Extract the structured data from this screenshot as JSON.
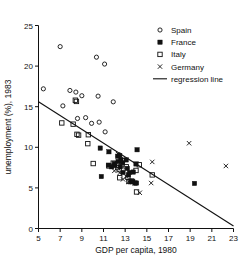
{
  "chart_data": {
    "type": "scatter",
    "title": "",
    "xlabel": "GDP per capita, 1980",
    "ylabel": "unemployment (%), 1983",
    "xlim": [
      5,
      23
    ],
    "ylim": [
      0,
      25
    ],
    "xticks": [
      5,
      7,
      9,
      11,
      13,
      15,
      17,
      19,
      21,
      23
    ],
    "yticks": [
      0,
      5,
      10,
      15,
      20,
      25
    ],
    "grid": false,
    "legend_position": "top-right",
    "legend": [
      {
        "name": "Spain",
        "marker": "open-circle"
      },
      {
        "name": "France",
        "marker": "filled-square"
      },
      {
        "name": "Italy",
        "marker": "open-square"
      },
      {
        "name": "Germany",
        "marker": "cross-x"
      },
      {
        "name": "regression line",
        "marker": "line"
      }
    ],
    "series": [
      {
        "name": "Spain",
        "marker": "open-circle",
        "points": [
          [
            5.45,
            17.2
          ],
          [
            7.0,
            22.4
          ],
          [
            7.25,
            15.1
          ],
          [
            7.9,
            17.0
          ],
          [
            8.45,
            16.8
          ],
          [
            8.6,
            13.55
          ],
          [
            9.0,
            16.35
          ],
          [
            9.35,
            13.65
          ],
          [
            9.9,
            12.95
          ],
          [
            10.35,
            21.1
          ],
          [
            10.5,
            16.3
          ],
          [
            10.6,
            13.1
          ],
          [
            11.1,
            20.25
          ],
          [
            11.15,
            11.9
          ],
          [
            11.9,
            15.6
          ]
        ]
      },
      {
        "name": "France",
        "marker": "filled-square",
        "points": [
          [
            10.7,
            9.9
          ],
          [
            10.8,
            6.4
          ],
          [
            11.5,
            9.45
          ],
          [
            11.45,
            7.8
          ],
          [
            11.75,
            7.6
          ],
          [
            12.0,
            8.0
          ],
          [
            12.05,
            7.75
          ],
          [
            12.3,
            8.9
          ],
          [
            12.35,
            8.25
          ],
          [
            12.5,
            9.0
          ],
          [
            12.55,
            7.6
          ],
          [
            12.6,
            8.5
          ],
          [
            12.75,
            8.1
          ],
          [
            12.8,
            6.9
          ],
          [
            13.1,
            8.45
          ],
          [
            13.2,
            7.4
          ],
          [
            13.3,
            6.6
          ],
          [
            13.4,
            6.9
          ],
          [
            13.5,
            5.75
          ],
          [
            13.7,
            5.8
          ],
          [
            13.75,
            6.95
          ],
          [
            13.9,
            5.6
          ],
          [
            14.0,
            7.95
          ],
          [
            14.05,
            5.6
          ],
          [
            14.1,
            9.7
          ],
          [
            19.4,
            5.55
          ]
        ]
      },
      {
        "name": "Italy",
        "marker": "open-square",
        "points": [
          [
            7.15,
            13.0
          ],
          [
            8.2,
            12.85
          ],
          [
            8.4,
            15.8
          ],
          [
            8.5,
            15.65
          ],
          [
            8.55,
            11.6
          ],
          [
            8.7,
            11.5
          ],
          [
            9.55,
            10.45
          ],
          [
            9.6,
            11.55
          ],
          [
            10.05,
            8.0
          ],
          [
            11.5,
            7.7
          ],
          [
            11.9,
            8.05
          ],
          [
            12.3,
            7.5
          ],
          [
            12.45,
            7.25
          ],
          [
            12.5,
            6.25
          ],
          [
            12.7,
            7.85
          ],
          [
            12.75,
            8.35
          ],
          [
            13.1,
            7.6
          ],
          [
            13.25,
            6.3
          ],
          [
            13.35,
            5.8
          ],
          [
            13.6,
            5.85
          ],
          [
            14.0,
            7.15
          ],
          [
            14.05,
            4.5
          ],
          [
            14.3,
            7.85
          ],
          [
            15.5,
            6.6
          ]
        ]
      },
      {
        "name": "Germany",
        "marker": "cross-x",
        "points": [
          [
            12.35,
            9.15
          ],
          [
            12.0,
            7.1
          ],
          [
            12.5,
            6.85
          ],
          [
            12.8,
            6.05
          ],
          [
            13.1,
            6.4
          ],
          [
            13.3,
            5.75
          ],
          [
            14.35,
            4.4
          ],
          [
            15.4,
            5.6
          ],
          [
            15.5,
            8.2
          ],
          [
            18.9,
            10.5
          ],
          [
            22.3,
            7.7
          ]
        ]
      }
    ],
    "regression_line": {
      "x0": 5.0,
      "y0": 15.6,
      "x1": 23.0,
      "y1": 0.3
    }
  }
}
